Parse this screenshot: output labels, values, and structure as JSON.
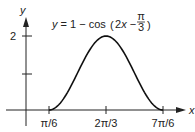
{
  "chart_data": {
    "type": "line",
    "title_parts": {
      "prefix": "y = 1 − cos",
      "inner": "2x − ",
      "frac_num": "π",
      "frac_den": "3"
    },
    "xlabel": "x",
    "ylabel": "y",
    "x_ticks": [
      "π/6",
      "2π/3",
      "7π/6"
    ],
    "y_ticks": [
      "2"
    ],
    "x_range": [
      0.5236,
      3.6652
    ],
    "ylim": [
      0,
      2
    ],
    "x": [
      0.5236,
      0.9163,
      1.309,
      1.7017,
      2.0944,
      2.4871,
      2.8798,
      3.2725,
      3.6652
    ],
    "values": [
      0,
      0.2929,
      1.0,
      1.7071,
      2.0,
      1.7071,
      1.0,
      0.2929,
      0
    ],
    "grid": false,
    "legend": "none"
  }
}
